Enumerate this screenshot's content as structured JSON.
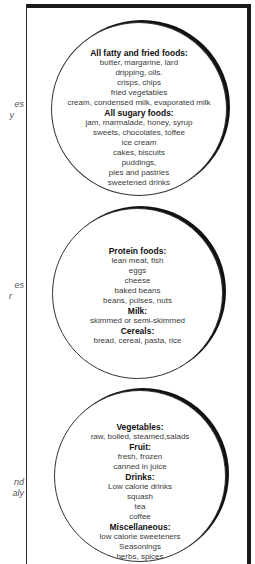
{
  "side_fragments": [
    {
      "lines": [
        "es",
        "y"
      ]
    },
    {
      "lines": [
        "es",
        "r"
      ]
    },
    {
      "lines": [
        "nd",
        "aly"
      ]
    }
  ],
  "circles": [
    {
      "name": "fatty-sugary-foods",
      "lines": [
        {
          "text": "All fatty and fried foods:",
          "heading": true
        },
        {
          "text": "butter, margarine, lard"
        },
        {
          "text": "dripping,  oils."
        },
        {
          "text": "crisps, chips"
        },
        {
          "text": "fried vegetables"
        },
        {
          "text": "cream, condensed milk, evaporated milk"
        },
        {
          "text": "All sugary foods:",
          "heading": true
        },
        {
          "text": "jam, marmalade, honey, syrup"
        },
        {
          "text": "sweets, chocolates, toffee"
        },
        {
          "text": "ice cream"
        },
        {
          "text": "cakes, biscuits"
        },
        {
          "text": "puddings,"
        },
        {
          "text": "pies and pastries"
        },
        {
          "text": "sweetened drinks"
        }
      ]
    },
    {
      "name": "protein-milk-cereals",
      "lines": [
        {
          "text": "Protein foods:",
          "heading": true
        },
        {
          "text": "lean meat, fish"
        },
        {
          "text": "eggs"
        },
        {
          "text": "cheese"
        },
        {
          "text": "baked beans"
        },
        {
          "text": "beans, pulses, nuts"
        },
        {
          "text": "Milk:",
          "heading": true
        },
        {
          "text": "skimmed or semi-skimmed"
        },
        {
          "text": "Cereals:",
          "heading": true
        },
        {
          "text": "bread, cereal, pasta, rice"
        }
      ]
    },
    {
      "name": "vegetables-fruit-drinks-misc",
      "lines": [
        {
          "text": "Vegetables:",
          "heading": true
        },
        {
          "text": "raw, boiled, steamed,salads"
        },
        {
          "text": "Fruit:",
          "heading": true
        },
        {
          "text": "fresh, frozen"
        },
        {
          "text": "canned in juice"
        },
        {
          "text": "Drinks:",
          "heading": true
        },
        {
          "text": "Low calorie drinks"
        },
        {
          "text": "squash"
        },
        {
          "text": "tea"
        },
        {
          "text": "coffee"
        },
        {
          "text": "Miscellaneous:",
          "heading": true
        },
        {
          "text": "low calorie sweeteners"
        },
        {
          "text": "Seasonings"
        },
        {
          "text": "herbs, spices"
        }
      ]
    }
  ]
}
